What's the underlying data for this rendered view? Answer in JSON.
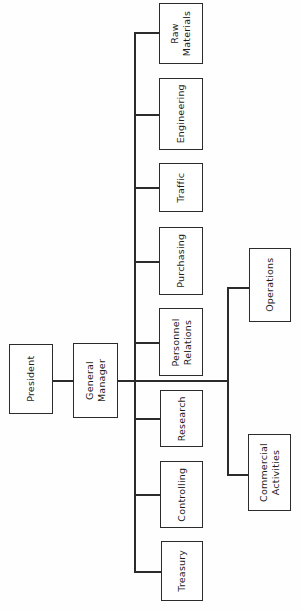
{
  "chart": {
    "type": "org-chart",
    "orientation": "rotated-90",
    "root": "President",
    "nodes": [
      {
        "id": "president",
        "label": "President",
        "level": 0
      },
      {
        "id": "general-manager",
        "label": "General Manager",
        "level": 1
      },
      {
        "id": "raw-materials",
        "label": "Raw Materials",
        "level": 2
      },
      {
        "id": "engineering",
        "label": "Engineering",
        "level": 2
      },
      {
        "id": "traffic",
        "label": "Traffic",
        "level": 2
      },
      {
        "id": "purchasing",
        "label": "Purchasing",
        "level": 2
      },
      {
        "id": "personnel-relations",
        "label": "Personnel Relations",
        "level": 2
      },
      {
        "id": "research",
        "label": "Research",
        "level": 2
      },
      {
        "id": "controlling",
        "label": "Controlling",
        "level": 2
      },
      {
        "id": "treasury",
        "label": "Treasury",
        "level": 2
      },
      {
        "id": "operations",
        "label": "Operations",
        "level": 3
      },
      {
        "id": "commercial-activities",
        "label": "Commercial Activities",
        "level": 3
      }
    ],
    "edges": [
      {
        "from": "president",
        "to": "general-manager"
      },
      {
        "from": "general-manager",
        "to": "raw-materials"
      },
      {
        "from": "general-manager",
        "to": "engineering"
      },
      {
        "from": "general-manager",
        "to": "traffic"
      },
      {
        "from": "general-manager",
        "to": "purchasing"
      },
      {
        "from": "general-manager",
        "to": "personnel-relations"
      },
      {
        "from": "general-manager",
        "to": "research"
      },
      {
        "from": "general-manager",
        "to": "controlling"
      },
      {
        "from": "general-manager",
        "to": "treasury"
      },
      {
        "from": "general-manager",
        "to": "operations"
      },
      {
        "from": "general-manager",
        "to": "commercial-activities"
      }
    ],
    "labels": {
      "president": "President",
      "general_manager_line1": "General",
      "general_manager_line2": "Manager",
      "raw_materials_line1": "Raw",
      "raw_materials_line2": "Materials",
      "engineering": "Engineering",
      "traffic": "Traffic",
      "purchasing": "Purchasing",
      "personnel_line1": "Personnel",
      "personnel_line2": "Relations",
      "research": "Research",
      "controlling": "Controlling",
      "treasury": "Treasury",
      "operations": "Operations",
      "commercial_line1": "Commercial",
      "commercial_line2": "Activities"
    },
    "colors": {
      "box_border": "#2b2b2b",
      "box_fill": "#ffffff",
      "connector": "#2b2b2b",
      "text": "#1d1d1d",
      "background": "#fefefe"
    }
  }
}
